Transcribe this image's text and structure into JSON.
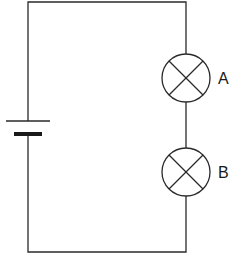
{
  "diagram": {
    "type": "circuit",
    "components": [
      {
        "kind": "cell",
        "label": ""
      },
      {
        "kind": "lamp",
        "label": "A"
      },
      {
        "kind": "lamp",
        "label": "B"
      }
    ],
    "lamp_a": {
      "label": "A"
    },
    "lamp_b": {
      "label": "B"
    },
    "colors": {
      "line": "#2a2a2a",
      "background": "#ffffff"
    }
  }
}
